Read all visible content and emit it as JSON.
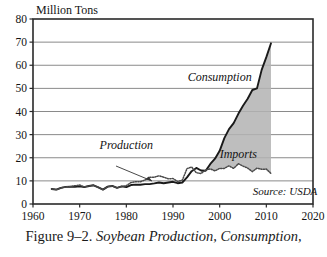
{
  "caption": {
    "number": "Figure 9–2.",
    "title": "Soybean Production, Consumption,"
  },
  "chart_data": {
    "type": "area",
    "title": "",
    "unit_label": "Million Tons",
    "xlabel": "",
    "ylabel": "Million Tons",
    "xlim": [
      1960,
      2020
    ],
    "ylim": [
      0,
      80
    ],
    "xticks": [
      1960,
      1970,
      1980,
      1990,
      2000,
      2010,
      2020
    ],
    "xticklabels": [
      "1960",
      "1970",
      "1980",
      "1990",
      "2000",
      "2010",
      "2020"
    ],
    "yticks": [
      0,
      10,
      20,
      30,
      40,
      50,
      60,
      70,
      80
    ],
    "yticklabels": [
      "0",
      "10",
      "20",
      "30",
      "40",
      "50",
      "60",
      "70",
      "80"
    ],
    "grid": "horizontal",
    "legend_position": "inline-annotations",
    "annotations": [
      {
        "name": "consumption",
        "text": "Consumption",
        "x": 2000,
        "y": 53
      },
      {
        "name": "imports",
        "text": "Imports",
        "x": 2004,
        "y": 20
      },
      {
        "name": "production",
        "text": "Production",
        "x": 1980,
        "y": 24
      },
      {
        "name": "source",
        "text": "Source: USDA",
        "x": 2014,
        "y": 4
      }
    ],
    "series": [
      {
        "name": "Consumption",
        "style": "solid-line",
        "color": "#1a1a1a",
        "x": [
          1964,
          1965,
          1966,
          1967,
          1968,
          1969,
          1970,
          1971,
          1972,
          1973,
          1974,
          1975,
          1976,
          1977,
          1978,
          1979,
          1980,
          1981,
          1982,
          1983,
          1984,
          1985,
          1986,
          1987,
          1988,
          1989,
          1990,
          1991,
          1992,
          1993,
          1994,
          1995,
          1996,
          1997,
          1998,
          1999,
          2000,
          2001,
          2002,
          2003,
          2004,
          2005,
          2006,
          2007,
          2008,
          2009,
          2010,
          2011
        ],
        "values": [
          6.5,
          6.2,
          7.0,
          7.4,
          7.5,
          7.4,
          7.6,
          7.3,
          7.8,
          8.1,
          7.2,
          6.2,
          7.5,
          7.8,
          7.0,
          7.6,
          7.3,
          8.2,
          8.4,
          8.3,
          8.6,
          8.6,
          8.9,
          9.3,
          9.0,
          9.3,
          9.6,
          9.0,
          9.3,
          11.5,
          14.2,
          15.6,
          14.5,
          14.4,
          17.3,
          19.6,
          23.0,
          28.5,
          32.4,
          35.0,
          39.0,
          42.5,
          45.5,
          49.3,
          50.0,
          58.0,
          63.5,
          69.5
        ]
      },
      {
        "name": "Production",
        "style": "dotted-line",
        "color": "#4a4a4a",
        "x": [
          1964,
          1965,
          1966,
          1967,
          1968,
          1969,
          1970,
          1971,
          1972,
          1973,
          1974,
          1975,
          1976,
          1977,
          1978,
          1979,
          1980,
          1981,
          1982,
          1983,
          1984,
          1985,
          1986,
          1987,
          1988,
          1989,
          1990,
          1991,
          1992,
          1993,
          1994,
          1995,
          1996,
          1997,
          1998,
          1999,
          2000,
          2001,
          2002,
          2003,
          2004,
          2005,
          2006,
          2007,
          2008,
          2009,
          2010,
          2011
        ],
        "values": [
          6.5,
          6.2,
          7.0,
          7.4,
          7.5,
          7.9,
          8.2,
          7.4,
          7.8,
          8.1,
          7.2,
          6.2,
          7.5,
          7.8,
          7.0,
          7.6,
          7.9,
          9.3,
          9.6,
          9.6,
          10.4,
          11.6,
          11.6,
          12.2,
          11.6,
          10.9,
          11.0,
          9.7,
          10.3,
          15.3,
          16.0,
          13.5,
          13.2,
          14.7,
          15.2,
          14.3,
          15.4,
          15.4,
          16.5,
          15.4,
          17.4,
          16.4,
          15.5,
          14.0,
          15.5,
          15.0,
          15.1,
          13.2
        ]
      }
    ],
    "filled_region": {
      "name": "Imports",
      "between": [
        "Production",
        "Consumption"
      ],
      "from_x": 1996,
      "to_x": 2011,
      "fill_color": "#b3b3b3"
    }
  }
}
